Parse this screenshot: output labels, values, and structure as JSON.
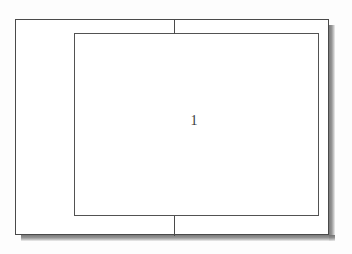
{
  "diagram": {
    "type": "nested-rectangles-schematic",
    "background_color": "#fdfdfd",
    "line_color": "#4a4a4a",
    "shadow_color": "#6f6f6f",
    "outer_frame": {
      "name": "outer-rectangle",
      "x": 15,
      "y": 19,
      "width": 314,
      "height": 216
    },
    "inner_frame": {
      "name": "inner-rectangle",
      "x": 74,
      "y": 33,
      "width": 245,
      "height": 183
    },
    "connectors": [
      {
        "name": "top-connector",
        "x": 174,
        "y": 19,
        "length": 15,
        "orientation": "vertical"
      },
      {
        "name": "bottom-connector",
        "x": 174,
        "y": 216,
        "length": 20,
        "orientation": "vertical"
      }
    ],
    "labels": [
      {
        "name": "reference-numeral",
        "text": "1",
        "x": 194,
        "y": 121
      }
    ]
  }
}
